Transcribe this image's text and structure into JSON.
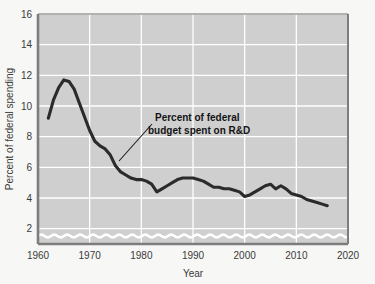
{
  "chart_data": {
    "type": "line",
    "title": "",
    "xlabel": "Year",
    "ylabel": "Percent of federal spending",
    "xlim": [
      1960,
      2020
    ],
    "ylim": [
      1,
      16
    ],
    "grid": true,
    "legend_position": "none",
    "y_axis_break": true,
    "xticks": [
      1960,
      1970,
      1980,
      1990,
      2000,
      2010,
      2020
    ],
    "xtick_labels": [
      "1960",
      "1970",
      "1980",
      "1990",
      "2000",
      "2010",
      "2020"
    ],
    "yticks": [
      2,
      4,
      6,
      8,
      10,
      12,
      14,
      16
    ],
    "ytick_labels": [
      "2",
      "4",
      "6",
      "8",
      "10",
      "12",
      "14",
      "16"
    ],
    "annotations": [
      {
        "text_line_1": "Percent of federal",
        "text_line_2": "budget spent on R&D",
        "points_to_year": 1975,
        "points_to_value": 5.7
      }
    ],
    "series": [
      {
        "name": "Percent of federal budget spent on R&D",
        "color": "#2b2b2b",
        "x": [
          1962,
          1963,
          1964,
          1965,
          1966,
          1967,
          1968,
          1969,
          1970,
          1971,
          1972,
          1973,
          1974,
          1975,
          1976,
          1977,
          1978,
          1979,
          1980,
          1981,
          1982,
          1983,
          1984,
          1985,
          1986,
          1987,
          1988,
          1989,
          1990,
          1991,
          1992,
          1993,
          1994,
          1995,
          1996,
          1997,
          1998,
          1999,
          2000,
          2001,
          2002,
          2003,
          2004,
          2005,
          2006,
          2007,
          2008,
          2009,
          2010,
          2011,
          2012,
          2013,
          2014,
          2015,
          2016
        ],
        "values": [
          9.2,
          10.4,
          11.2,
          11.7,
          11.6,
          11.1,
          10.2,
          9.3,
          8.4,
          7.7,
          7.4,
          7.2,
          6.8,
          6.1,
          5.7,
          5.5,
          5.3,
          5.2,
          5.2,
          5.1,
          4.9,
          4.4,
          4.6,
          4.8,
          5.0,
          5.2,
          5.3,
          5.3,
          5.3,
          5.2,
          5.1,
          4.9,
          4.7,
          4.7,
          4.6,
          4.6,
          4.5,
          4.4,
          4.1,
          4.2,
          4.4,
          4.6,
          4.8,
          4.9,
          4.6,
          4.8,
          4.6,
          4.3,
          4.2,
          4.1,
          3.9,
          3.8,
          3.7,
          3.6,
          3.5
        ]
      }
    ]
  }
}
